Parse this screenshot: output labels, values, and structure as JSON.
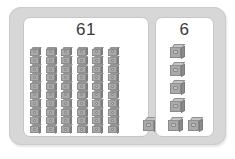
{
  "activity": {
    "title": "Place value cubes comparison",
    "manipulative": "unit-cubes"
  },
  "colors": {
    "frame": "#d7d7d7",
    "panel": "#ffffff",
    "cube_face": "#a9a9a9",
    "cube_top": "#c2c2c2",
    "cube_side": "#8d8d8d",
    "number_text": "#3a3a3a"
  },
  "panels": [
    {
      "id": "left",
      "count_label": "61",
      "count_value": 61,
      "tens_rods": 6,
      "cubes_per_rod": 10,
      "loose_ones": 1,
      "loose_positions": [
        {
          "left": 119,
          "bottom": 4
        }
      ]
    },
    {
      "id": "right",
      "count_label": "6",
      "count_value": 6,
      "tens_rods": 0,
      "cubes_per_rod": 0,
      "loose_ones": 6,
      "loose_positions": [
        {
          "left": 14,
          "top": 2
        },
        {
          "left": 14,
          "top": 20
        },
        {
          "left": 14,
          "top": 38
        },
        {
          "left": 14,
          "top": 56
        },
        {
          "left": 12,
          "top": 75
        },
        {
          "left": 32,
          "top": 75
        }
      ]
    }
  ]
}
